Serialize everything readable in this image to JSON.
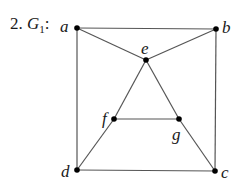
{
  "caption": {
    "number": "2.",
    "graph_name": "G",
    "graph_subscript": "1",
    "colon": ":"
  },
  "graph": {
    "nodes": [
      {
        "id": "a",
        "label": "a",
        "x": 77,
        "y": 28
      },
      {
        "id": "b",
        "label": "b",
        "x": 216,
        "y": 29
      },
      {
        "id": "e",
        "label": "e",
        "x": 146,
        "y": 60
      },
      {
        "id": "f",
        "label": "f",
        "x": 114,
        "y": 119
      },
      {
        "id": "g",
        "label": "g",
        "x": 179,
        "y": 119
      },
      {
        "id": "d",
        "label": "d",
        "x": 77,
        "y": 170
      },
      {
        "id": "c",
        "label": "c",
        "x": 215,
        "y": 171
      }
    ],
    "edges": [
      [
        "a",
        "b"
      ],
      [
        "a",
        "e"
      ],
      [
        "e",
        "b"
      ],
      [
        "a",
        "d"
      ],
      [
        "b",
        "c"
      ],
      [
        "e",
        "f"
      ],
      [
        "e",
        "g"
      ],
      [
        "f",
        "g"
      ],
      [
        "f",
        "d"
      ],
      [
        "g",
        "c"
      ],
      [
        "d",
        "c"
      ]
    ]
  },
  "colors": {
    "edge": "#555555",
    "node": "#000000",
    "text": "#1a1a1a"
  }
}
